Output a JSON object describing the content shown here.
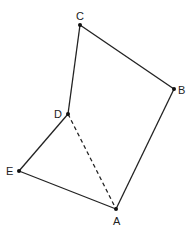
{
  "diagram": {
    "type": "pentagon",
    "points": [
      {
        "name": "A",
        "x": 116,
        "y": 209,
        "lx": 113,
        "ly": 225
      },
      {
        "name": "B",
        "x": 174,
        "y": 89,
        "lx": 178,
        "ly": 94
      },
      {
        "name": "C",
        "x": 80,
        "y": 25,
        "lx": 76,
        "ly": 20
      },
      {
        "name": "D",
        "x": 68,
        "y": 114,
        "lx": 54,
        "ly": 118
      },
      {
        "name": "E",
        "x": 19,
        "y": 171,
        "lx": 6,
        "ly": 175
      }
    ],
    "solid_edges": [
      [
        "A",
        "B"
      ],
      [
        "B",
        "C"
      ],
      [
        "C",
        "D"
      ],
      [
        "D",
        "E"
      ],
      [
        "E",
        "A"
      ]
    ],
    "dashed_edges": [
      [
        "D",
        "A"
      ]
    ],
    "colors": {
      "line": "#222222",
      "point": "#111111"
    }
  }
}
